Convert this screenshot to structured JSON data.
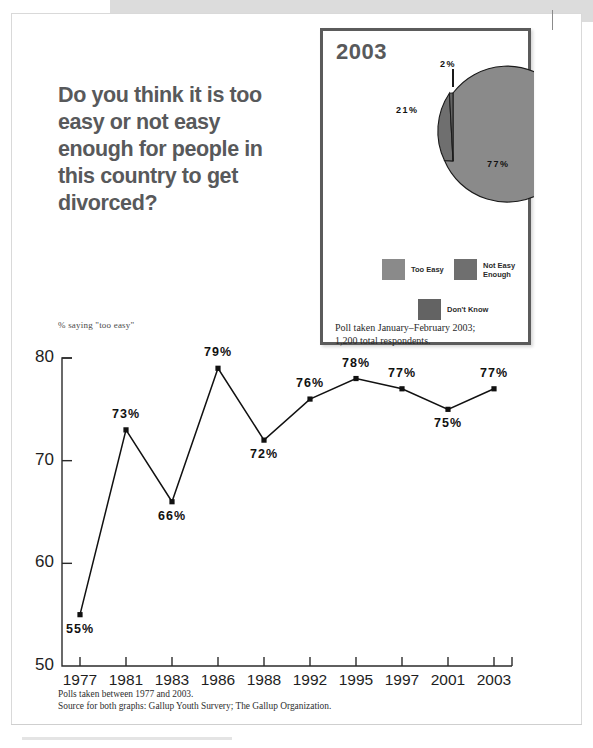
{
  "headline": {
    "question": "Do you think it is too easy or not easy enough for people in this country to get divorced?"
  },
  "pie_panel": {
    "year": "2003",
    "labels": {
      "slice_don_t_know": "2%",
      "slice_not_easy_enough": "21%",
      "slice_too_easy": "77%"
    },
    "legend": [
      {
        "label": "Too Easy",
        "color": "#8a8a8a"
      },
      {
        "label": "Not Easy\nEnough",
        "color": "#6f6f6f"
      },
      {
        "label": "Don't Know",
        "color": "#636363"
      }
    ],
    "poll_note": "Poll taken January–February 2003;\n  1,200 total respondents."
  },
  "line_chart": {
    "caption": "% saying \"too easy\""
  },
  "footnotes": {
    "line1": "Polls taken between 1977 and 2003.",
    "line2": "Source for both graphs: Gallup Youth Survery; The Gallup Organization."
  },
  "chart_data": [
    {
      "type": "pie",
      "title": "2003",
      "labels": [
        "Too Easy",
        "Not Easy Enough",
        "Don't Know"
      ],
      "values": [
        77,
        21,
        2
      ],
      "value_labels": [
        "77%",
        "21%",
        "2%"
      ],
      "colors": [
        "#8a8a8a",
        "#6f6f6f",
        "#636363"
      ],
      "legend": "bottom",
      "annotations": [
        "Poll taken January–February 2003; 1,200 total respondents."
      ]
    },
    {
      "type": "line",
      "title": "",
      "ylabel": "% saying \"too easy\"",
      "xlabel": "",
      "ylim": [
        50,
        80
      ],
      "yticks": [
        50,
        60,
        70,
        80
      ],
      "ytick_labels": [
        "50",
        "60",
        "70",
        "80"
      ],
      "grid": false,
      "categories": [
        "1977",
        "1981",
        "1983",
        "1986",
        "1988",
        "1992",
        "1995",
        "1997",
        "2001",
        "2003"
      ],
      "values": [
        55,
        73,
        66,
        79,
        72,
        76,
        78,
        77,
        75,
        77
      ],
      "value_labels": [
        "55%",
        "73%",
        "66%",
        "79%",
        "72%",
        "76%",
        "78%",
        "77%",
        "75%",
        "77%"
      ],
      "marker": "square",
      "line_color": "#111111",
      "annotations": [
        "Polls taken between 1977 and 2003.",
        "Source for both graphs: Gallup Youth Survery; The Gallup Organization."
      ]
    }
  ]
}
